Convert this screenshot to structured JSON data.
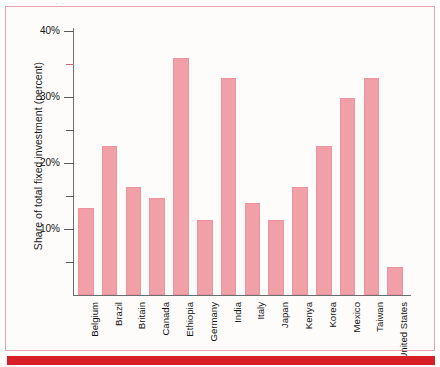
{
  "figure": {
    "top_scrap_text": "·  ·",
    "background_color": "#fdfcfa",
    "frame_color": "#e8a7ae",
    "red_band_color": "#d81f27",
    "bar_color": "#f2a0a8",
    "axis_color": "#6e6e6e"
  },
  "chart_data": {
    "type": "bar",
    "title": "",
    "subtitle": "",
    "xlabel": "",
    "ylabel": "Share of total fixed investment (percent)",
    "ylim": [
      0,
      40
    ],
    "grid": false,
    "legend": null,
    "ytick_labels": [
      "40%",
      "30%",
      "20%",
      "10%"
    ],
    "ytick_values": [
      40,
      30,
      20,
      10
    ],
    "minor_tick_values": [
      35,
      25,
      15,
      5
    ],
    "categories": [
      "Belgium",
      "Brazil",
      "Britain",
      "Canada",
      "Ethiopia",
      "Germany",
      "India",
      "Italy",
      "Japan",
      "Kenya",
      "Korea",
      "Mexico",
      "Taiwan",
      "United States"
    ],
    "values": [
      13.2,
      22.6,
      16.3,
      14.7,
      35.9,
      11.4,
      32.9,
      14.0,
      11.4,
      16.4,
      22.6,
      29.8,
      32.9,
      4.2
    ],
    "value_unit": "percent"
  }
}
